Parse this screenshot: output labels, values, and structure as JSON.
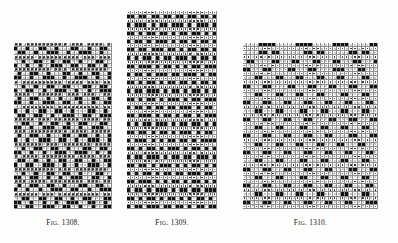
{
  "page": {
    "background_color": "#fdfdfc",
    "ink_color": "#111111",
    "kind": "scanned-book-plate"
  },
  "figures": [
    {
      "id": "fig-1308",
      "caption": "Fig. 1308.",
      "caption_prefix": "F",
      "caption_smallcaps": "IG.",
      "caption_number": " 1308.",
      "x": 14,
      "y": 43,
      "width": 98,
      "height": 166,
      "cols": 24,
      "rows": 40,
      "cell_size": 4.1,
      "symbols_used": [
        "cross",
        "filled",
        "open",
        "dot"
      ],
      "legend": {
        "cross": "x",
        "filled": "black square",
        "open": "empty square",
        "dot": "small dot"
      },
      "pattern": [
        "xx.xxxxxxxxxx.xxx.xxxx.x",
        "f..f..ff..f...ff..f..ff.",
        ".ff..f..fff..f..fff..f..",
        "xxxxx.xxxxxxxxxx.xxx.xxx",
        "..f..ff..f..ff..f...ff..",
        "f..f..f..fff..ff..ff..f.",
        "xxxxxxxxx.xxx.xxxxxxxxx.",
        ".f..ff..f...ff..f..ff..f",
        "ff..f..fff..f..fff..f..f",
        "x.xxxxxxxxxx.xxxx.xxx.xx",
        "..f..f..ff..ff...ff..ff.",
        "f..ff..f..fff..f..f..fff",
        "xxxx..xxxxxx.xxx.xxx..xx",
        ".f..ff..f..f...ff..ff..f",
        "ff..f..fff..ff..f..f..ff",
        "..xxxxxxxx.xxxxxxxxxx.xx",
        "f..f..ff..ff..f...ff..f.",
        ".ff..ff..f..fff..ff..fff",
        "xxxxx.xxx.xxxxxx.xxxx.xx",
        "..ff..f..ff..f..ff...ff.",
        "ff..f..fff..ff..f..fff..",
        "xxx.xxxxxxxxx.xxxx.xxxxx",
        ".f..ff..f...ff..ff..f..f",
        "f..f..fff..ff..f..fff..f",
        "xxxxxxx.xxx.xxxxxxx.xxxx",
        "..f..ff..ff..f...ff..ff.",
        "ff..f..f..fff..fff..f..f",
        "x.xxxx.xxxxxxxx.xxxx.xxx",
        ".ff..f..f..ff..ff..f..ff",
        "f..ff..fff..f..f..fff..f",
        "xxxxxxxxxx.xxx.xxxxxxxx.",
        "..f..f..ff..ff..f...ff..",
        "ff..ff..f..f..fff..ff..f",
        "xxx.xxxx.xxxxxxxx.xxx.xx",
        ".f..ff..ff..f...ff..ff..",
        "f..f..f..fff..ff..f..fff",
        "xxxxxx.xxx.xxxxxxxxxx.xx",
        "..ff..ff..ff..f..ff...ff",
        "ff..f..f..f..fff..ff..f.",
        "f..ff..fff..ff..f..f..ff"
      ]
    },
    {
      "id": "fig-1309",
      "caption": "Fig. 1309.",
      "caption_prefix": "F",
      "caption_smallcaps": "IG.",
      "caption_number": " 1309.",
      "x": 127,
      "y": 11,
      "width": 90,
      "height": 198,
      "cols": 22,
      "rows": 48,
      "cell_size": 4.1,
      "symbols_used": [
        "filled",
        "open",
        "dot"
      ],
      "legend": {
        "filled": "black square",
        "open": "empty square",
        "dot": "dotted square"
      },
      "pattern": [
        "ddddddd.dddddddddddddd",
        "ff.ff.ff.ff.ff.ff.ff.f",
        "dddd.ddddddd.dddddd.dd",
        "f.fff.f.ff.fff.f.fff.f",
        "dddddddd.ddddddddd.ddd",
        "ff.f.ff.ff.f.ff.ff.f.f",
        "ddd.dddddddd.ddddddddd",
        "f.ff.f.fff.f.ff.f.ff.f",
        "dddddd.ddd.ddddddd.ddd",
        "ff.ff.fff.ff.f.ff.ff.f",
        "ddddddddd.dddddd.ddddd",
        "f.f.ff.f.ff.fff.f.ff.f",
        "dddd.dddddddd.ddddd.dd",
        "ff.fff.f.ff.f.f.ff.fff",
        "ddddddd.ddd.ddddddddd.",
        "f.ff.f.fff.ff.fff.f.ff",
        "dd.dddddddddd.dddd.ddd",
        "ff.f.ff.f.ff.ff.f.ff.f",
        "ddddddd.dddddddd.ddddd",
        "f.ff.fff.f.ff.f.ff.f.f",
        "dddd.dddddd.dddddddd.d",
        "ff.f.ff.f.fff.f.ff.fff",
        "ddddddddd.ddd.dddddddd",
        "f.ff.f.ff.ff.fff.f.ff.",
        "ddd.dddddddddd.ddddd.d",
        "ff.fff.f.ff.f.ff.f.fff",
        "dddddd.ddd.dddddddd.dd",
        "f.f.ff.fff.f.ff.ff.f.f",
        "dddddddddd.dddd.dddddd",
        "ff.ff.f.ff.f.fff.f.ff.",
        "dddd.dddddddd.dddddd.d",
        "f.fff.f.f.ff.ff.f.ffff",
        "ddddddd.ddddd.ddddddd.",
        "ff.f.ff.f.fff.f.ff.f.f",
        "ddd.ddddddddd.ddd.dddd",
        "f.ff.fff.f.ff.ff.fff.f",
        "dddddd.dd.dddddddd.ddd",
        "ff.ff.f.fff.f.f.ff.f.f",
        "dddddddddd.dddddd.dddd",
        "f.f.ff.f.ff.ff.fff.ff.",
        "dddd.ddddddd.dddd.dddd",
        "ff.fff.f.f.ff.f.ff.f.f",
        "ddddddd.dddddddd.ddddd",
        "f.ff.f.fff.f.ff.ff.fff",
        "ddd.dddddddd.dddddd.dd",
        "ff.f.ff.f.ff.f.f.ff.f.",
        "dddddddd.ddd.ddddddddd",
        "f.ff.fff.ff.ff.f.ff.ff"
      ]
    },
    {
      "id": "fig-1310",
      "caption": "Fig. 1310.",
      "caption_prefix": "F",
      "caption_smallcaps": "IG.",
      "caption_number": " 1310.",
      "x": 243,
      "y": 43,
      "width": 135,
      "height": 166,
      "cols": 33,
      "rows": 40,
      "cell_size": 4.1,
      "symbols_used": [
        "filled",
        "open",
        "dot"
      ],
      "legend": {
        "filled": "black square",
        "open": "open circle",
        "dot": "dotted square"
      },
      "pattern": [
        "ooo.ffff.ooo.ffff.ooo.ffff.ooo.ff",
        "d.dd.dd.dd.dd.dd.dd.dd.dd.dd.dd.d",
        "o.ooff.ff.oo.ooff.ff.oo.ooff.ff.o",
        "dd.dd.d.dd.dd.d.dd.dd.d.dd.dd.d.d",
        "off.oo.ffoo.ffo.offo.offoo.ffo.of",
        "d.d.dd.dd.d.dd.dd.d.dd.dd.d.dd.dd",
        "ff.ooff.oo.ffoo.ffoo.offf.ooff.oo",
        "dd.dd.d.dd.d.dd.dd.dd.d.dd.dd.d.d",
        "o.offoo.ff.ooffo.offoo.ffoo.offo.",
        "d.dd.dd.d.dd.dd.d.dd.d.dd.dd.dd.d",
        "ffoo.ffoo.offo.offoo.ffo.offoo.ff",
        "dd.d.dd.dd.d.dd.dd.d.dd.dd.dd.d.d",
        "oo.ffoo.ffo.offoo.ffoo.offo.offoo",
        "d.dd.dd.d.dd.dd.dd.d.dd.d.dd.dd.d",
        "ffo.offo.offoo.ffoo.ffo.offoo.ffo",
        "dd.dd.d.dd.dd.d.dd.dd.dd.d.dd.d.d",
        "o.offoo.ffoo.offo.offoo.ffo.offoo",
        "d.d.dd.dd.dd.d.dd.dd.d.dd.dd.dd.d",
        "ffoo.ffo.offoo.ffoo.offo.offoo.ff",
        "dd.dd.dd.d.dd.dd.d.dd.dd.dd.d.dd.",
        "oo.ffoo.ffoo.offo.offoo.ffoo.ffo.",
        "d.dd.d.dd.dd.dd.d.dd.d.dd.dd.dd.d",
        "ffo.offoo.ffo.offoo.ffoo.offo.off",
        "dd.d.dd.dd.dd.d.dd.dd.d.dd.dd.d.d",
        "o.offoo.ffoo.ffo.offo.offoo.ffoo.",
        "d.dd.dd.d.dd.d.dd.dd.dd.d.dd.dd.d",
        "ffoo.ffo.offoo.ffoo.ffo.offoo.ffo",
        "dd.dd.d.dd.dd.dd.d.dd.d.dd.dd.d.d",
        "oo.ffoo.ffoo.offo.offoo.ffo.offoo",
        "d.d.dd.dd.d.dd.dd.dd.d.dd.dd.dd.d",
        "ffo.offo.offoo.ffoo.ffoo.offo.off",
        "dd.dd.dd.d.dd.d.dd.dd.d.dd.dd.d.d",
        "o.offoo.ffoo.offo.offoo.ffoo.ffo.",
        "d.dd.d.dd.dd.dd.d.dd.dd.dd.d.dd.d",
        "ffoo.ffo.offo.offoo.ffo.offoo.ffo",
        "dd.d.dd.dd.dd.d.dd.d.dd.dd.dd.d.d",
        "oo.ffo.offoo.ffoo.ffoo.offo.offoo",
        "d.dd.dd.d.dd.dd.d.dd.dd.d.dd.dd.d",
        "ffo.offoo.ffo.offoo.ffo.offoo.fff",
        "dd.dd.d.dd.dd.d.dd.dd.dd.d.dd.d.d"
      ]
    }
  ],
  "captions": {
    "fig1308": {
      "prefix": "F",
      "small": "IG",
      "rest": ". 1308."
    },
    "fig1309": {
      "prefix": "F",
      "small": "IG",
      "rest": ". 1309."
    },
    "fig1310": {
      "prefix": "F",
      "small": "IG",
      "rest": ". 1310."
    }
  }
}
